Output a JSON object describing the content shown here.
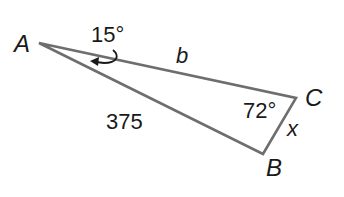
{
  "diagram": {
    "type": "triangle",
    "vertices": [
      {
        "id": "A",
        "label": "A"
      },
      {
        "id": "B",
        "label": "B"
      },
      {
        "id": "C",
        "label": "C"
      }
    ],
    "angles": {
      "A": "15°",
      "C": "72°"
    },
    "sides": {
      "AC": "b",
      "AB": "375",
      "BC": "x"
    },
    "colors": {
      "stroke": "#6e6e6e",
      "text": "#1a1a1a",
      "background": "#ffffff"
    }
  }
}
